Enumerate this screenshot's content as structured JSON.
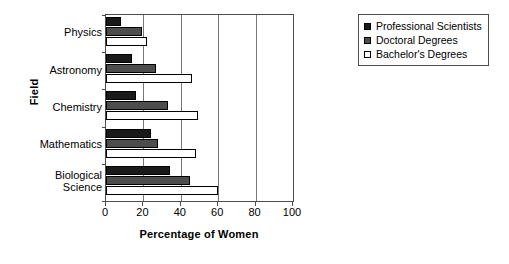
{
  "chart_data": {
    "type": "bar",
    "orientation": "horizontal",
    "title": "",
    "xlabel": "Percentage of Women",
    "ylabel": "Field",
    "categories": [
      "Physics",
      "Astronomy",
      "Chemistry",
      "Mathematics",
      "Biological\nScience"
    ],
    "series": [
      {
        "name": "Professional Scientists",
        "color": "#1a1a1a",
        "values": [
          8,
          14,
          16,
          24,
          34
        ]
      },
      {
        "name": "Doctoral Degrees",
        "color": "#4d4d4d",
        "values": [
          19,
          27,
          33,
          28,
          45
        ]
      },
      {
        "name": "Bachelor's Degrees",
        "color": "#ffffff",
        "values": [
          22,
          46,
          49,
          48,
          60
        ]
      }
    ],
    "xlim": [
      0,
      100
    ],
    "xticks": [
      0,
      20,
      40,
      60,
      80,
      100
    ],
    "xtick_labels": [
      "0",
      "20",
      "40",
      "60",
      "80",
      "100"
    ],
    "grid": true,
    "grid_axis": "x",
    "legend_position": "right-top"
  },
  "legend": {
    "entries": [
      {
        "label": "Professional Scientists"
      },
      {
        "label": "Doctoral Degrees"
      },
      {
        "label": "Bachelor's Degrees"
      }
    ]
  }
}
